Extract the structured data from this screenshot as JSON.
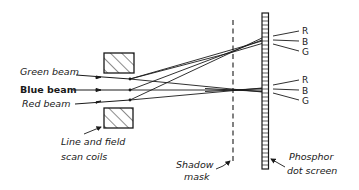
{
  "diagram": {
    "labels": {
      "green_beam": "Green beam",
      "blue_beam": "Blue beam",
      "red_beam": "Red beam",
      "coils_line1": "Line and field",
      "coils_line2": "scan coils",
      "mask_line1": "Shadow",
      "mask_line2": "mask",
      "screen_line1": "Phosphor",
      "screen_line2": "dot screen"
    },
    "dot_groups": [
      {
        "name": "upper",
        "dots": [
          "R",
          "B",
          "G"
        ]
      },
      {
        "name": "lower",
        "dots": [
          "R",
          "B",
          "G"
        ]
      }
    ],
    "colors": {
      "ink": "#1a1a1a",
      "background": "#ffffff"
    }
  }
}
